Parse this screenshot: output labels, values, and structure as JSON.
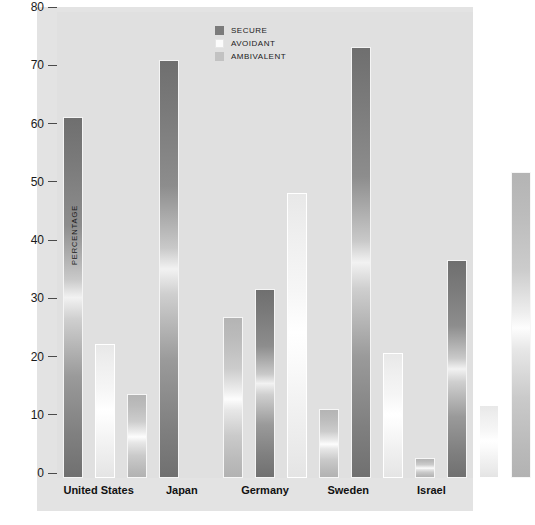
{
  "chart_data": {
    "type": "bar",
    "title": "",
    "xlabel": "",
    "ylabel": "PERCENTAGE",
    "ylim": [
      0,
      80
    ],
    "yticks": [
      0,
      10,
      20,
      30,
      40,
      50,
      60,
      70,
      80
    ],
    "grid": false,
    "legend_position": "top-center-right",
    "categories": [
      "United States",
      "Japan",
      "Germany",
      "Sweden",
      "Israel"
    ],
    "series": [
      {
        "name": "SECURE",
        "color": "#7b7b7b",
        "values": [
          62,
          71.8,
          32.5,
          74,
          37.5
        ]
      },
      {
        "name": "AVOIDANT",
        "color": "#fcfcfc",
        "values": [
          23,
          0,
          49,
          21.5,
          12.5
        ]
      },
      {
        "name": "AMBIVALENT",
        "color": "#c2c2c2",
        "values": [
          14.5,
          27.7,
          11.8,
          3.5,
          52.5
        ]
      }
    ]
  },
  "legend": {
    "items": [
      {
        "label": "SECURE"
      },
      {
        "label": "AVOIDANT"
      },
      {
        "label": "AMBIVALENT"
      }
    ]
  },
  "axis": {
    "y_title": "PERCENTAGE",
    "ticks": [
      "80",
      "70",
      "60",
      "50",
      "40",
      "30",
      "20",
      "10",
      "0"
    ]
  }
}
